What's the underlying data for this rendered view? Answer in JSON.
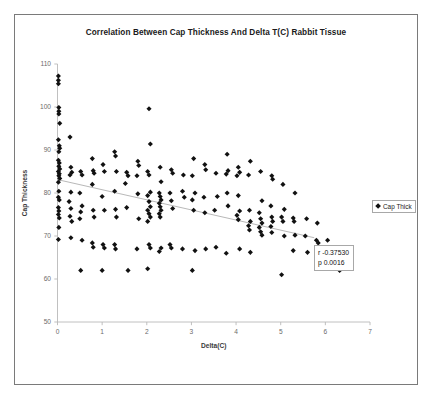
{
  "chart_data": {
    "type": "scatter",
    "title": "Correlation Between Cap Thickness And Delta T(C) Rabbit Tissue",
    "xlabel": "Delta(C)",
    "ylabel": "Cap Thickness",
    "xlim": [
      0,
      7
    ],
    "ylim": [
      50,
      110
    ],
    "xticks": [
      "0",
      "1",
      "2",
      "3",
      "4",
      "5",
      "6",
      "7"
    ],
    "yticks": [
      "50",
      "60",
      "70",
      "80",
      "90",
      "100",
      "110"
    ],
    "grid": false,
    "legend": {
      "position": "right-outside",
      "entries": [
        {
          "label": "Cap Thick",
          "marker": "diamond",
          "color": "#111111"
        }
      ]
    },
    "annotations": [
      {
        "name": "correlation-stats",
        "lines": [
          "r -0.37530",
          "p 0.0016"
        ]
      }
    ],
    "trendline": {
      "name": "linear-fit",
      "color": "#b0b0b0",
      "x": [
        0.05,
        5.75
      ],
      "y": [
        83.0,
        69.6
      ]
    },
    "series": [
      {
        "name": "Cap Thick",
        "marker": "diamond",
        "color": "#111111",
        "points": [
          [
            0.02,
            107.2
          ],
          [
            0.02,
            106.2
          ],
          [
            0.02,
            105.4
          ],
          [
            0.03,
            99.9
          ],
          [
            0.03,
            99.0
          ],
          [
            0.03,
            98.4
          ],
          [
            0.05,
            96.2
          ],
          [
            0.02,
            92.4
          ],
          [
            0.04,
            91.0
          ],
          [
            0.05,
            90.4
          ],
          [
            0.03,
            89.6
          ],
          [
            0.02,
            87.6
          ],
          [
            0.04,
            87.0
          ],
          [
            0.03,
            86.2
          ],
          [
            0.05,
            85.6
          ],
          [
            0.02,
            85.0
          ],
          [
            0.04,
            84.5
          ],
          [
            0.03,
            84.0
          ],
          [
            0.05,
            83.4
          ],
          [
            0.02,
            82.5
          ],
          [
            0.03,
            80.4
          ],
          [
            0.02,
            79.0
          ],
          [
            0.04,
            78.4
          ],
          [
            0.02,
            76.6
          ],
          [
            0.03,
            75.8
          ],
          [
            0.02,
            75.0
          ],
          [
            0.04,
            74.2
          ],
          [
            0.03,
            72.0
          ],
          [
            0.02,
            69.2
          ],
          [
            0.28,
            93.0
          ],
          [
            0.3,
            86.0
          ],
          [
            0.32,
            84.8
          ],
          [
            0.28,
            84.2
          ],
          [
            0.3,
            80.2
          ],
          [
            0.26,
            78.0
          ],
          [
            0.3,
            76.4
          ],
          [
            0.28,
            74.6
          ],
          [
            0.32,
            73.4
          ],
          [
            0.3,
            69.6
          ],
          [
            0.52,
            85.0
          ],
          [
            0.55,
            84.2
          ],
          [
            0.5,
            80.0
          ],
          [
            0.55,
            77.0
          ],
          [
            0.52,
            75.6
          ],
          [
            0.5,
            74.0
          ],
          [
            0.55,
            69.0
          ],
          [
            0.52,
            62.0
          ],
          [
            0.78,
            88.0
          ],
          [
            0.8,
            85.2
          ],
          [
            0.82,
            84.6
          ],
          [
            0.78,
            82.0
          ],
          [
            0.8,
            76.0
          ],
          [
            0.82,
            74.4
          ],
          [
            0.78,
            68.4
          ],
          [
            0.8,
            67.4
          ],
          [
            1.02,
            86.6
          ],
          [
            1.05,
            85.0
          ],
          [
            1.0,
            79.2
          ],
          [
            1.05,
            76.0
          ],
          [
            1.02,
            68.0
          ],
          [
            1.05,
            67.2
          ],
          [
            1.0,
            62.0
          ],
          [
            1.28,
            89.6
          ],
          [
            1.3,
            88.6
          ],
          [
            1.32,
            85.0
          ],
          [
            1.28,
            80.4
          ],
          [
            1.3,
            76.2
          ],
          [
            1.32,
            74.4
          ],
          [
            1.28,
            68.0
          ],
          [
            1.3,
            67.0
          ],
          [
            1.55,
            84.8
          ],
          [
            1.58,
            84.0
          ],
          [
            1.52,
            82.2
          ],
          [
            1.55,
            76.6
          ],
          [
            1.58,
            62.0
          ],
          [
            1.8,
            87.4
          ],
          [
            1.82,
            86.4
          ],
          [
            1.78,
            84.0
          ],
          [
            1.8,
            79.8
          ],
          [
            1.82,
            74.0
          ],
          [
            1.78,
            67.0
          ],
          [
            2.05,
            99.6
          ],
          [
            2.08,
            91.4
          ],
          [
            2.02,
            85.0
          ],
          [
            2.05,
            84.2
          ],
          [
            2.08,
            80.2
          ],
          [
            2.02,
            79.4
          ],
          [
            2.05,
            78.0
          ],
          [
            2.08,
            76.8
          ],
          [
            2.02,
            76.0
          ],
          [
            2.05,
            75.2
          ],
          [
            2.08,
            74.4
          ],
          [
            2.02,
            73.4
          ],
          [
            2.05,
            68.0
          ],
          [
            2.08,
            67.2
          ],
          [
            2.02,
            62.4
          ],
          [
            2.3,
            86.0
          ],
          [
            2.32,
            82.6
          ],
          [
            2.28,
            80.0
          ],
          [
            2.3,
            79.2
          ],
          [
            2.32,
            78.4
          ],
          [
            2.28,
            77.6
          ],
          [
            2.3,
            76.8
          ],
          [
            2.32,
            76.0
          ],
          [
            2.28,
            75.2
          ],
          [
            2.3,
            74.4
          ],
          [
            2.32,
            67.2
          ],
          [
            2.28,
            66.4
          ],
          [
            2.55,
            85.4
          ],
          [
            2.58,
            84.6
          ],
          [
            2.52,
            80.0
          ],
          [
            2.55,
            78.2
          ],
          [
            2.58,
            76.4
          ],
          [
            2.52,
            68.0
          ],
          [
            2.55,
            67.2
          ],
          [
            2.82,
            84.2
          ],
          [
            2.8,
            80.4
          ],
          [
            2.84,
            79.0
          ],
          [
            2.8,
            67.0
          ],
          [
            3.05,
            88.0
          ],
          [
            3.02,
            84.0
          ],
          [
            3.08,
            80.0
          ],
          [
            3.02,
            78.4
          ],
          [
            3.05,
            76.0
          ],
          [
            3.08,
            66.6
          ],
          [
            3.02,
            62.0
          ],
          [
            3.3,
            86.6
          ],
          [
            3.32,
            85.4
          ],
          [
            3.28,
            79.0
          ],
          [
            3.3,
            75.4
          ],
          [
            3.32,
            67.0
          ],
          [
            3.55,
            84.6
          ],
          [
            3.58,
            79.2
          ],
          [
            3.52,
            76.0
          ],
          [
            3.55,
            67.4
          ],
          [
            3.8,
            89.0
          ],
          [
            3.82,
            85.2
          ],
          [
            3.78,
            84.4
          ],
          [
            3.8,
            80.0
          ],
          [
            3.82,
            77.0
          ],
          [
            3.78,
            66.0
          ],
          [
            4.05,
            86.0
          ],
          [
            4.08,
            84.8
          ],
          [
            4.02,
            84.0
          ],
          [
            4.05,
            79.4
          ],
          [
            4.08,
            75.8
          ],
          [
            4.02,
            74.8
          ],
          [
            4.05,
            73.8
          ],
          [
            4.08,
            67.0
          ],
          [
            4.32,
            87.4
          ],
          [
            4.28,
            84.2
          ],
          [
            4.3,
            76.0
          ],
          [
            4.32,
            73.4
          ],
          [
            4.28,
            72.4
          ],
          [
            4.3,
            71.4
          ],
          [
            4.32,
            66.2
          ],
          [
            4.55,
            85.0
          ],
          [
            4.58,
            78.2
          ],
          [
            4.52,
            75.4
          ],
          [
            4.55,
            74.0
          ],
          [
            4.58,
            73.0
          ],
          [
            4.52,
            72.0
          ],
          [
            4.55,
            71.0
          ],
          [
            4.58,
            70.2
          ],
          [
            4.8,
            84.0
          ],
          [
            4.82,
            83.2
          ],
          [
            4.78,
            77.0
          ],
          [
            4.8,
            74.4
          ],
          [
            4.82,
            73.4
          ],
          [
            4.78,
            72.2
          ],
          [
            4.8,
            70.8
          ],
          [
            5.05,
            82.0
          ],
          [
            5.08,
            76.2
          ],
          [
            5.02,
            74.4
          ],
          [
            5.05,
            73.4
          ],
          [
            5.08,
            70.0
          ],
          [
            5.02,
            61.0
          ],
          [
            5.32,
            80.0
          ],
          [
            5.28,
            74.2
          ],
          [
            5.3,
            73.4
          ],
          [
            5.32,
            70.2
          ],
          [
            5.28,
            66.6
          ],
          [
            5.58,
            74.0
          ],
          [
            5.55,
            70.0
          ],
          [
            5.6,
            66.2
          ],
          [
            5.82,
            73.0
          ],
          [
            5.8,
            69.0
          ],
          [
            5.84,
            68.4
          ],
          [
            6.05,
            69.0
          ],
          [
            6.08,
            66.0
          ],
          [
            6.32,
            62.0
          ]
        ]
      }
    ]
  },
  "legend": {
    "label": "Cap Thick"
  },
  "stats": {
    "r_label": "r -0.37530",
    "p_label": "p 0.0016"
  }
}
